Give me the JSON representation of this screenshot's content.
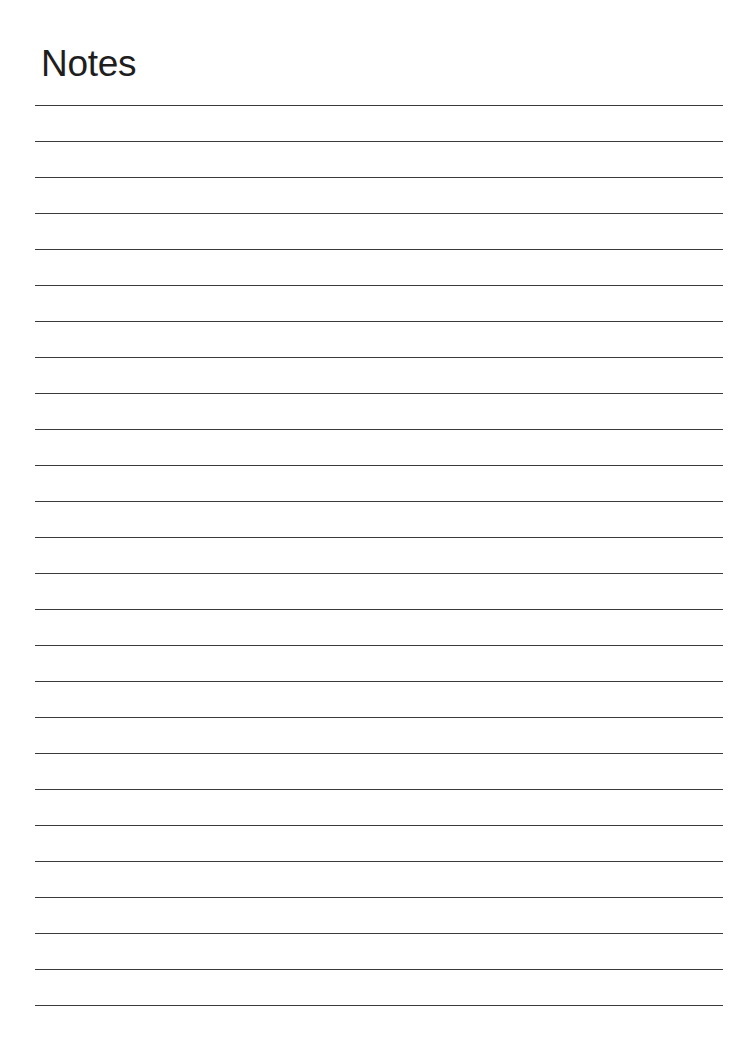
{
  "page": {
    "title": "Notes",
    "line_count": 26,
    "line_color": "#3a3a3a",
    "background": "#ffffff"
  }
}
